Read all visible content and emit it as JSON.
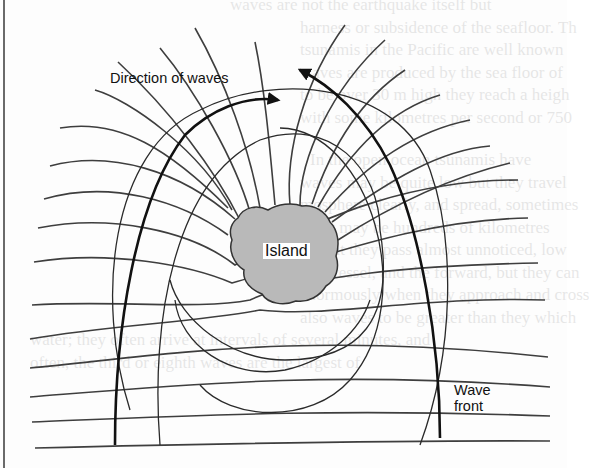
{
  "diagram": {
    "type": "wave-refraction-around-island",
    "labels": {
      "direction": "Direction of waves",
      "island": "Island",
      "wave_front_line1": "Wave",
      "wave_front_line2": "front"
    },
    "colors": {
      "island_fill": "#b9b9b9",
      "lines": "#3a3a3a",
      "bold_lines": "#111111",
      "background": "#fdfdfd"
    }
  },
  "background_text": {
    "lines": [
      "waves are not the earthquake itself but",
      "harness or subsidence of the seafloor. Th",
      "tsunamis in the Pacific are well known",
      "waves are produced by the sea floor of",
      "to be over 30 m high they reach a heigh",
      "with some kilometres per second or 750",
      "",
      "In the open ocean tsunamis have",
      "waves may be quite low but they travel",
      "mosphere clearly, and spread, sometimes",
      "other may be hundreds of kilometres",
      "so that they pass almost unnoticed, low",
      "of a vessel, and the forward, but they can",
      "enormously when they approach and cross",
      "also waves to be greater than they which",
      "water; they often arrive at intervals of several minutes, and",
      "often, the third or eighth waves are the largest of"
    ]
  }
}
